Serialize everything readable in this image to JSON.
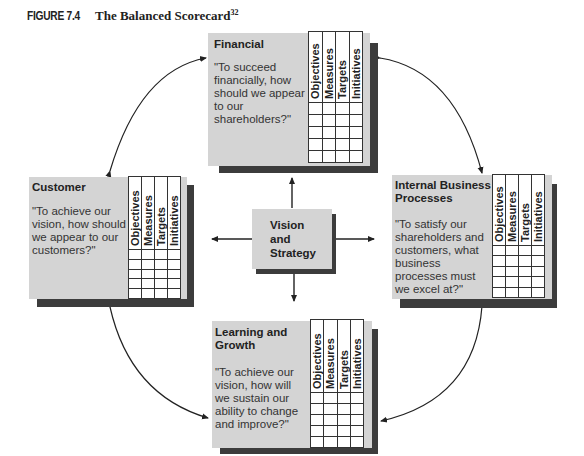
{
  "figure": {
    "number": "FIGURE 7.4",
    "title": "The Balanced Scorecard",
    "footnote_ref": "32"
  },
  "table_columns": [
    "Objectives",
    "Measures",
    "Targets",
    "Initiatives"
  ],
  "table_rows": 5,
  "center": {
    "label_line1": "Vision",
    "label_line2": "and",
    "label_line3": "Strategy"
  },
  "perspectives": {
    "financial": {
      "title": "Financial",
      "question": "\"To succeed financially, how should we appear to our shareholders?\""
    },
    "customer": {
      "title": "Customer",
      "question": "\"To achieve our vision, how should we appear to our customers?\""
    },
    "internal": {
      "title": "Internal Business Processes",
      "question": "\"To satisfy our shareholders and customers, what business processes must we excel at?\""
    },
    "learning": {
      "title": "Learning and Growth",
      "question": "\"To achieve our vision, how will we sustain our ability to change and improve?\""
    }
  },
  "colors": {
    "panel": "#d4d4d4",
    "shadow": "#3c3c3c",
    "line": "#222222"
  }
}
